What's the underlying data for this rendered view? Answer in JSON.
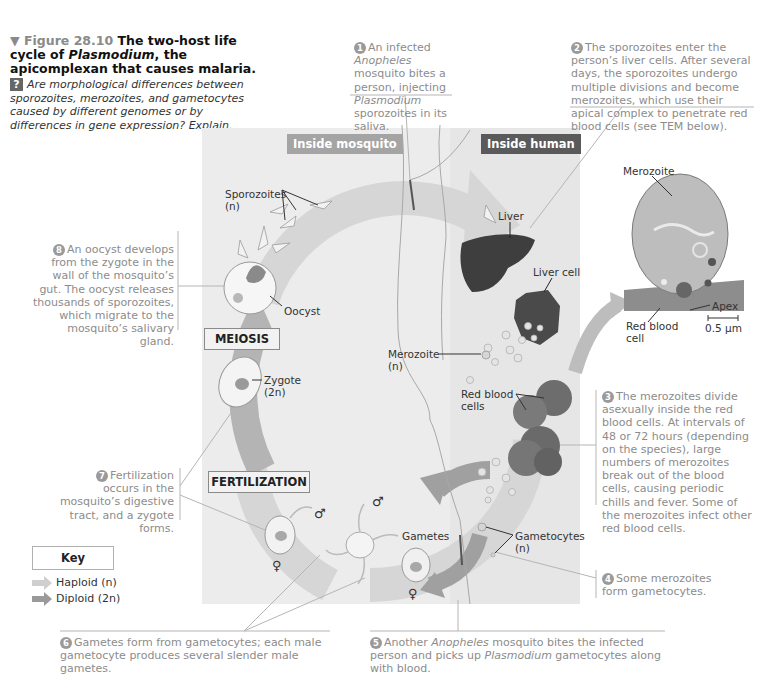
{
  "figure": {
    "marker": "▼",
    "number_label": "Figure 28.10",
    "title_main": "The two-host life cycle of",
    "title_italic": "Plasmodium",
    "title_rest": ", the apicomplexan that causes malaria.",
    "question_badge": "?",
    "question": "Are morphological differences between sporozoites, merozoites, and gametocytes caused by different genomes or by differences in gene expression? Explain."
  },
  "panels": {
    "mosquito_header": "Inside mosquito",
    "human_header": "Inside human"
  },
  "steps": [
    {
      "num": "1",
      "text_a": "An infected ",
      "italic_a": "Anopheles",
      "text_b": " mosquito bites a person, injecting ",
      "italic_b": "Plasmodium",
      "text_c": " sporozoites in its saliva."
    },
    {
      "num": "2",
      "text": "The sporozoites enter the person’s liver cells. After several days, the sporozoites undergo multiple divisions and become merozoites, which use their apical complex to penetrate red blood cells (see TEM below)."
    },
    {
      "num": "3",
      "text": "The merozoites divide asexually inside the red blood cells. At intervals of 48 or 72 hours (depending on the species), large numbers of merozoites break out of the blood cells, causing periodic chills and fever. Some of the merozoites infect other red blood cells."
    },
    {
      "num": "4",
      "text": "Some merozoites form gametocytes."
    },
    {
      "num": "5",
      "text_a": "Another ",
      "italic_a": "Anopheles",
      "text_b": " mosquito bites the infected person and picks up ",
      "italic_b": "Plasmodium",
      "text_c": " gametocytes along with blood."
    },
    {
      "num": "6",
      "text": "Gametes form from gametocytes; each male gametocyte produces several slender male gametes."
    },
    {
      "num": "7",
      "text": "Fertilization occurs in the mosquito’s digestive tract, and a zygote forms."
    },
    {
      "num": "8",
      "text": "An oocyst develops from the zygote in the wall of the mosquito’s gut. The oocyst releases thousands of sporozoites, which migrate to the mosquito’s salivary gland."
    }
  ],
  "labels": {
    "sporozoites": "Sporozoites",
    "sporozoites_ploidy": "(n)",
    "oocyst": "Oocyst",
    "meiosis": "MEIOSIS",
    "zygote": "Zygote",
    "zygote_ploidy": "(2n)",
    "fertilization": "FERTILIZATION",
    "liver": "Liver",
    "liver_cell": "Liver cell",
    "merozoite": "Merozoite",
    "merozoite_ploidy": "(n)",
    "red_blood_cells": "Red blood cells",
    "gametes": "Gametes",
    "gametocytes": "Gametocytes",
    "gametocytes_ploidy": "(n)",
    "male_symbol": "♂",
    "female_symbol": "♀"
  },
  "tem": {
    "merozoite": "Merozoite",
    "apex": "Apex",
    "red_blood_cell": "Red blood cell",
    "scale_bar": "0.5 µm"
  },
  "key": {
    "title": "Key",
    "items": [
      {
        "label": "Haploid (n)",
        "color": "#c8c8c8"
      },
      {
        "label": "Diploid (2n)",
        "color": "#8f8f8f"
      }
    ]
  },
  "colors": {
    "panel_mosquito": "#ececec",
    "panel_human": "#e6e6e6",
    "header_mosquito": "#a4a4a4",
    "header_human": "#5a5a5a",
    "haploid_arrow": "#d2d2d2",
    "diploid_arrow": "#a8a8a8",
    "step_text": "#8c8c8c"
  }
}
